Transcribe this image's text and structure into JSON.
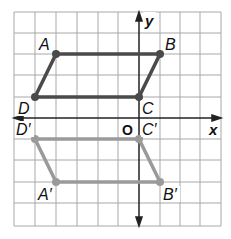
{
  "axes": {
    "x_label": "x",
    "y_label": "y",
    "origin_label": "O"
  },
  "grid": {
    "xmin": -6,
    "xmax": 4,
    "ymin": -5,
    "ymax": 5
  },
  "colors": {
    "original": "#4a4a4a",
    "image": "#9a9a9a",
    "grid": "#9a9a9a",
    "axis": "#222222"
  },
  "original": {
    "name": "ABCD",
    "points": [
      {
        "label": "A",
        "x": -4,
        "y": 3
      },
      {
        "label": "B",
        "x": 1,
        "y": 3
      },
      {
        "label": "C",
        "x": 0,
        "y": 1
      },
      {
        "label": "D",
        "x": -5,
        "y": 1
      }
    ]
  },
  "image": {
    "name": "A'B'C'D'",
    "points": [
      {
        "label": "A'",
        "x": -4,
        "y": -3
      },
      {
        "label": "B'",
        "x": 1,
        "y": -3
      },
      {
        "label": "C'",
        "x": 0,
        "y": -1
      },
      {
        "label": "D'",
        "x": -5,
        "y": -1
      }
    ]
  },
  "labels": {
    "A": "A",
    "B": "B",
    "C": "C",
    "D": "D",
    "A_prime": "A′",
    "B_prime": "B′",
    "C_prime": "C′",
    "D_prime": "D′"
  }
}
